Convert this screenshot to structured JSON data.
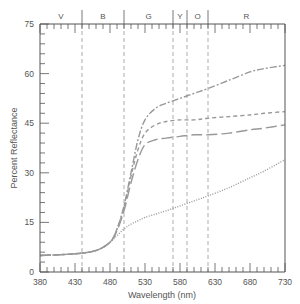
{
  "chart_data": {
    "type": "line",
    "title": "",
    "xlabel": "Wavelength (nm)",
    "ylabel": "Percent Reflectance",
    "xlim": [
      380,
      730
    ],
    "ylim": [
      0,
      75
    ],
    "x_ticks": [
      380,
      430,
      480,
      530,
      580,
      630,
      680,
      730
    ],
    "y_ticks": [
      0,
      15,
      30,
      45,
      60,
      75
    ],
    "grid": false,
    "legend": "none",
    "bands": [
      {
        "label": "V",
        "from": 380,
        "to": 440
      },
      {
        "label": "B",
        "from": 440,
        "to": 500
      },
      {
        "label": "G",
        "from": 500,
        "to": 570
      },
      {
        "label": "Y",
        "from": 570,
        "to": 590
      },
      {
        "label": "O",
        "from": 590,
        "to": 620
      },
      {
        "label": "R",
        "from": 620,
        "to": 730
      }
    ],
    "band_dividers": [
      440,
      500,
      570,
      590,
      620
    ],
    "series": [
      {
        "name": "dash-dot (highest)",
        "style": "dashdot",
        "x": [
          380,
          430,
          460,
          480,
          490,
          500,
          510,
          520,
          530,
          545,
          560,
          580,
          600,
          620,
          650,
          680,
          700,
          730
        ],
        "values": [
          5,
          5.5,
          6.5,
          9,
          13,
          20,
          30,
          40,
          46,
          49.5,
          51,
          52.5,
          54,
          55.5,
          58,
          60.5,
          61.5,
          62.5
        ]
      },
      {
        "name": "short dash",
        "style": "dashed",
        "x": [
          380,
          430,
          460,
          480,
          490,
          500,
          510,
          520,
          530,
          545,
          560,
          580,
          600,
          620,
          650,
          680,
          700,
          730
        ],
        "values": [
          5,
          5.5,
          6.5,
          9,
          13,
          19.5,
          29,
          37,
          42,
          44.5,
          45.5,
          46,
          46,
          46.5,
          47,
          47.5,
          48,
          48.5
        ]
      },
      {
        "name": "long dash",
        "style": "longdash",
        "x": [
          380,
          430,
          460,
          480,
          490,
          500,
          510,
          520,
          530,
          545,
          560,
          580,
          600,
          620,
          650,
          680,
          700,
          730
        ],
        "values": [
          5,
          5.5,
          6.5,
          9,
          12.5,
          18.5,
          27,
          34,
          38.5,
          40,
          40.5,
          41,
          41.5,
          41.5,
          42,
          43,
          43.5,
          44.5
        ]
      },
      {
        "name": "dotted (lowest)",
        "style": "dotted",
        "x": [
          380,
          430,
          460,
          480,
          490,
          500,
          510,
          520,
          530,
          545,
          560,
          580,
          600,
          620,
          650,
          680,
          700,
          730
        ],
        "values": [
          5,
          5.5,
          6.5,
          9,
          11,
          13,
          14.5,
          15.5,
          16.5,
          17.5,
          18.5,
          20,
          21.5,
          23,
          25.5,
          28.5,
          30.5,
          34
        ]
      }
    ]
  }
}
